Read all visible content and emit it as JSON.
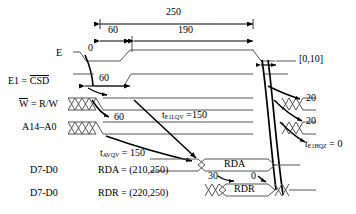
{
  "diagram": {
    "type": "timing-diagram"
  },
  "top_measures": {
    "total": "250",
    "first": "60",
    "second": "190"
  },
  "signal_labels": {
    "e": "E",
    "e1_prefix": "E1 = ",
    "e1_bar": "CSD",
    "w_bar": "W",
    "w_rest": " = R/W",
    "addr": "A14–A0",
    "data_a": "D7-D0",
    "data_r": "D7-D0"
  },
  "annotations": {
    "e_zero": "0",
    "e1_sixty": "60",
    "w_sixty": "60",
    "range_0_10": "[0,10]",
    "right_20_a": "20",
    "right_20_b": "20",
    "t_e1lqv_sym": "t",
    "t_e1lqv_sub": "E1LQV",
    "t_e1lqv_val": " =150",
    "t_avqv_sym": "t",
    "t_avqv_sub": "AVQV",
    "t_avqv_val": " = 150",
    "t_e1hqz_sym": "t",
    "t_e1hqz_sub": "E1HQZ",
    "t_e1hqz_val": " = 0",
    "bus_30": "30",
    "bus_0": "0"
  },
  "bus_values": {
    "rda_bus": "RDA",
    "rdr_bus": "RDR",
    "rda_expr": "RDA = (210,250)",
    "rdr_expr": "RDR = (220,250)"
  },
  "colors": {
    "ink": "#000000",
    "wave": "#555555",
    "background": "#ffffff"
  }
}
